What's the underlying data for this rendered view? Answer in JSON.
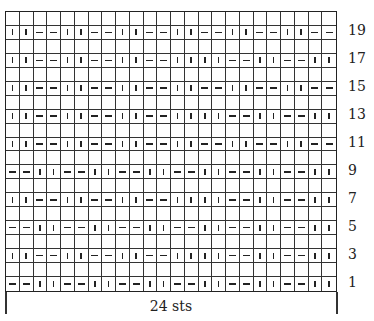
{
  "chart": {
    "stitch_count_label": "24 sts",
    "columns": 24,
    "rows": 20,
    "symbols": {
      "|": "knit",
      "-": "purl",
      " ": "blank"
    },
    "pattern_rows": {
      "20": "                        ",
      "19": "||--||--||--||--||--||--",
      "18": "                        ",
      "17": "||--||--||--||||--||--||",
      "16": "                        ",
      "15": "||--||--||--||--||--||--",
      "14": "                        ",
      "13": "||--||--||--||||--||--||",
      "12": "                        ",
      "11": "||--||--||--||--||--||--",
      "10": "                        ",
      "9": "--||--||--||--||--||--||",
      "8": "                        ",
      "7": "||--||--||--||||--||--||",
      "6": "                        ",
      "5": "--||--||--||--||--||--||",
      "4": "                        ",
      "3": "||--||--||--||||--||--||",
      "2": "                        ",
      "1": "--||--||--||--||--||--||"
    },
    "row_labels": [
      "19",
      "17",
      "15",
      "13",
      "11",
      "9",
      "7",
      "5",
      "3",
      "1"
    ]
  }
}
